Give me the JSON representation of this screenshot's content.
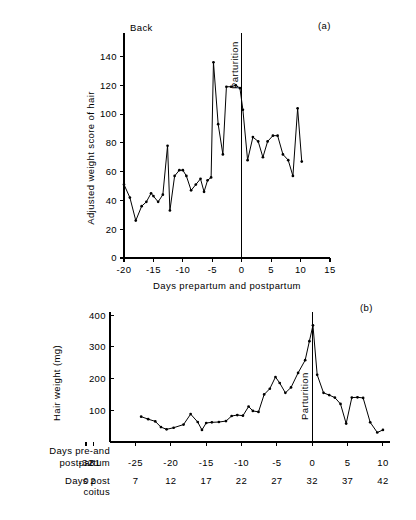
{
  "figure": {
    "background": "#ffffff",
    "ink": "#000000"
  },
  "chart_data": [
    {
      "id": "panel-a",
      "type": "line",
      "panel_tag": "(a)",
      "title": "",
      "xlabel": "Days prepartum and postpartum",
      "ylabel": "Adjusted weight score of hair",
      "xlim": [
        -20,
        15
      ],
      "ylim": [
        0,
        148
      ],
      "xticks": [
        -20,
        -15,
        -10,
        -5,
        0,
        5,
        10,
        15
      ],
      "xticklabels": [
        "-20",
        "-15",
        "-10",
        "-5",
        "0",
        "5",
        "10",
        "15"
      ],
      "yticks": [
        0,
        20,
        40,
        60,
        80,
        100,
        120,
        140
      ],
      "yticklabels": [
        "0",
        "20",
        "40",
        "60",
        "80",
        "100",
        "120",
        "140"
      ],
      "grid": false,
      "legend": "none",
      "annotations": [
        {
          "text": "Back",
          "x": -20,
          "orientation": "horizontal"
        },
        {
          "text": "Parturition",
          "x": 0,
          "orientation": "vertical"
        }
      ],
      "vertical_rules": [
        -20,
        0
      ],
      "x": [
        -20,
        -19,
        -18,
        -17,
        -16.2,
        -15.4,
        -15,
        -14.2,
        -13.4,
        -12.6,
        -12.2,
        -11.4,
        -10.6,
        -10,
        -9.4,
        -8.6,
        -7.8,
        -7,
        -6.4,
        -5.8,
        -5.2,
        -4.8,
        -4,
        -3.2,
        -2.6,
        -1.8,
        -1,
        -0.3,
        0.2,
        1,
        1.9,
        2.8,
        3.6,
        4.4,
        5.3,
        6.1,
        7,
        7.9,
        8.7,
        9.5,
        10.2
      ],
      "values": [
        51,
        42,
        26,
        36,
        39,
        45,
        43,
        39,
        44,
        78,
        33,
        57,
        61,
        61,
        57,
        47,
        51,
        55,
        46,
        54,
        56,
        136,
        93,
        72,
        119,
        119,
        120,
        118,
        103,
        68,
        84,
        81,
        70,
        81,
        85,
        85,
        72,
        68,
        57,
        104,
        67
      ]
    },
    {
      "id": "panel-b",
      "type": "line",
      "panel_tag": "(b)",
      "title": "",
      "xlabel": "",
      "ylabel": "Hair weight (mg)",
      "xlim": [
        -32,
        11
      ],
      "ylim": [
        0,
        410
      ],
      "xticks": [
        -32,
        -31,
        -25,
        -20,
        -15,
        -10,
        -5,
        0,
        5,
        10
      ],
      "xticklabels_row1": [
        "-32",
        "-31",
        "-25",
        "-20",
        "-15",
        "-10",
        "-5",
        "0",
        "5",
        "10"
      ],
      "xticklabels_row2": [
        "0",
        "2",
        "7",
        "12",
        "17",
        "22",
        "27",
        "32",
        "37",
        "42"
      ],
      "row1_label_line1": "Days pre-and",
      "row1_label_line2": "postpartum",
      "row2_label_line1": "Days post",
      "row2_label_line2": "coitus",
      "yticks": [
        100,
        200,
        300,
        400
      ],
      "yticklabels": [
        "100",
        "200",
        "300",
        "400"
      ],
      "grid": false,
      "legend": "none",
      "annotations": [
        {
          "text": "Parturition",
          "x": 0,
          "orientation": "vertical"
        }
      ],
      "vertical_rules": [
        0
      ],
      "x": [
        -24.2,
        -23.2,
        -22.2,
        -21.4,
        -20.6,
        -19.6,
        -18.2,
        -17.2,
        -16.2,
        -15.6,
        -15,
        -14.2,
        -13.2,
        -12.2,
        -11.4,
        -10.6,
        -9.8,
        -9,
        -8.4,
        -7.6,
        -6.8,
        -6,
        -5.2,
        -4.6,
        -3.8,
        -3,
        -2,
        -1,
        -0.4,
        0.1,
        0.7,
        1.6,
        2.4,
        3.2,
        4,
        4.8,
        5.6,
        6.4,
        7.2,
        8.2,
        9.2,
        10
      ],
      "values": [
        80,
        72,
        65,
        47,
        40,
        45,
        55,
        88,
        63,
        38,
        60,
        62,
        63,
        66,
        82,
        85,
        83,
        112,
        98,
        95,
        150,
        168,
        205,
        186,
        155,
        172,
        218,
        258,
        318,
        368,
        212,
        155,
        148,
        140,
        120,
        58,
        140,
        141,
        139,
        62,
        30,
        38
      ]
    }
  ]
}
